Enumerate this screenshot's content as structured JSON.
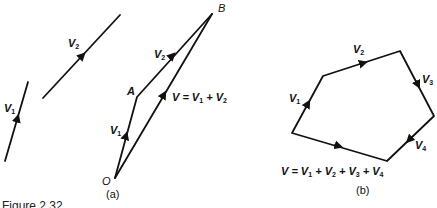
{
  "figure": {
    "caption": "Figure 2.32",
    "panels": [
      {
        "id": "a",
        "label": "(a)",
        "description": "Vector addition by triangle method",
        "points": {
          "O": "O",
          "A": "A",
          "B": "B"
        },
        "free_vectors": [
          {
            "name": "V",
            "sub": "1"
          },
          {
            "name": "V",
            "sub": "2"
          }
        ],
        "triangle_vectors": [
          {
            "name": "V",
            "sub": "1",
            "from": "O",
            "to": "A"
          },
          {
            "name": "V",
            "sub": "2",
            "from": "A",
            "to": "B"
          }
        ],
        "resultant": {
          "prefix": "V = V",
          "sub1": "1",
          "mid": " + V",
          "sub2": "2"
        }
      },
      {
        "id": "b",
        "label": "(b)",
        "description": "Vector addition by polygon method",
        "vectors": [
          {
            "name": "V",
            "sub": "1"
          },
          {
            "name": "V",
            "sub": "2"
          },
          {
            "name": "V",
            "sub": "3"
          },
          {
            "name": "V",
            "sub": "4"
          }
        ],
        "resultant": {
          "text": "V = V1 + V2 + V3 + V4",
          "parts": [
            "V = V",
            "1",
            " + V",
            "2",
            " + V",
            "3",
            " + V",
            "4"
          ]
        }
      }
    ]
  }
}
